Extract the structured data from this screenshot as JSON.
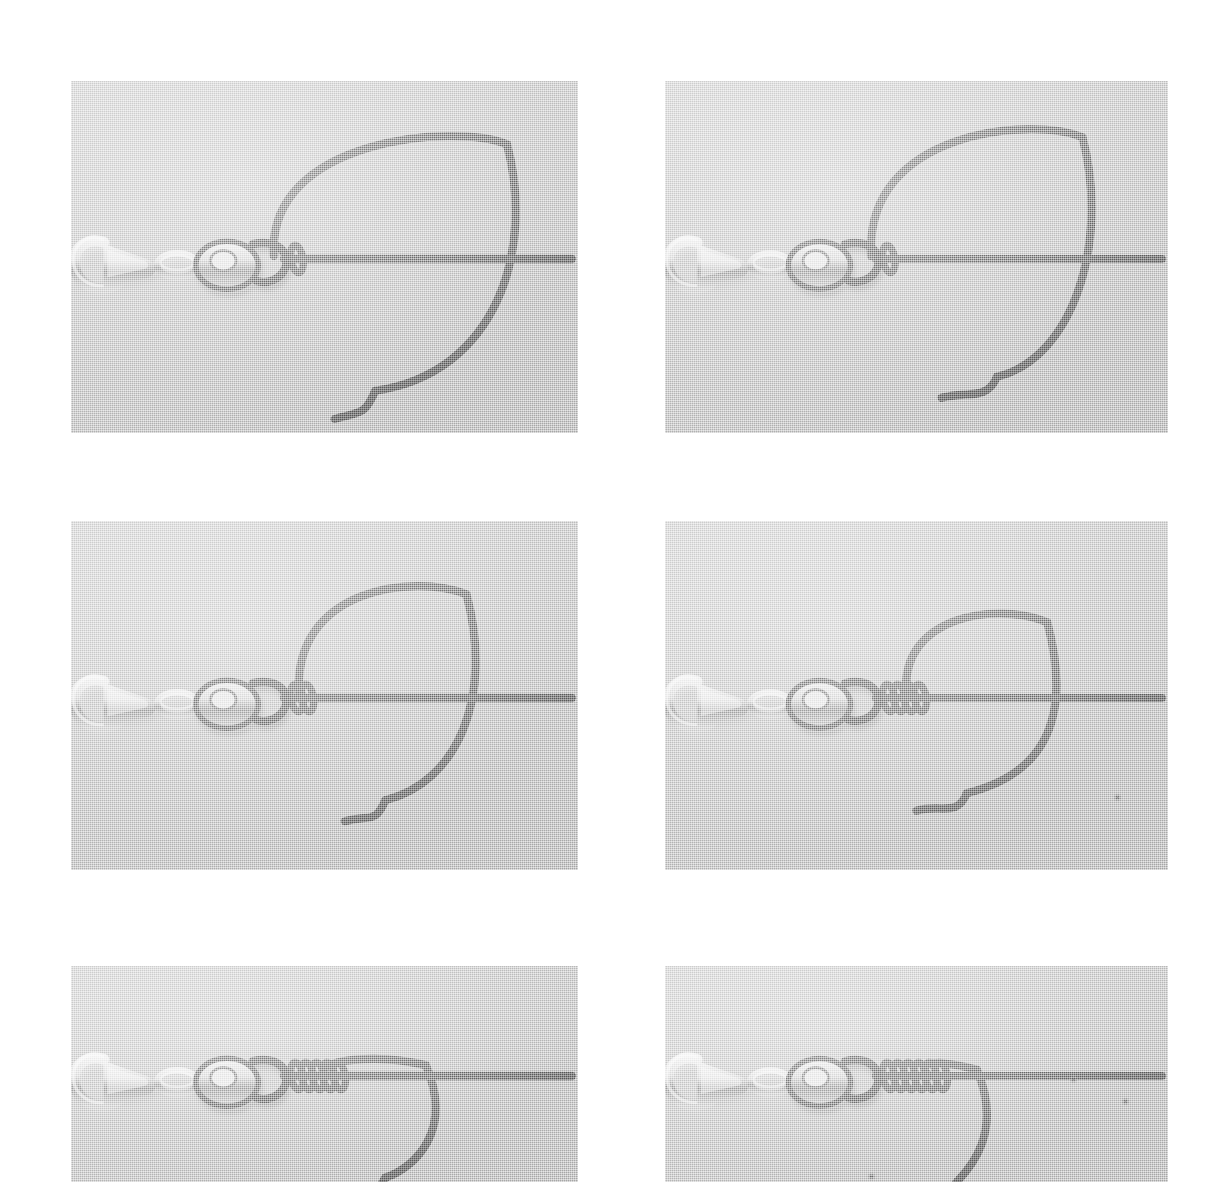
{
  "sheet": {
    "title": "Fishing knot tying photo sequence",
    "layout": "2 columns x 3 rows of photographs",
    "page_background": "#ffffff",
    "photo_background": "#c9c9c9",
    "line_color": "#6e6e6e",
    "hardware_color": "#d8d8d8"
  },
  "panels": [
    {
      "id": "panel-1",
      "step_number": "1",
      "caption": "Loose overhand loop formed: tag end passed through swivel eye and crossed over the standing line, large open loop hanging below",
      "x": 71,
      "y": 81,
      "width": 507,
      "height": 352,
      "wrap_count": 1,
      "loop_size": "large",
      "tag_end_position": "below-left, pointing left",
      "subject": "snap swivel with monofilament loop"
    },
    {
      "id": "panel-2",
      "step_number": "2",
      "caption": "Loop drawn slightly smaller, tag end brought around to the right side of the standing line",
      "x": 665,
      "y": 81,
      "width": 503,
      "height": 352,
      "wrap_count": 1,
      "loop_size": "large",
      "tag_end_position": "below-centre, curling left",
      "subject": "snap swivel with monofilament loop"
    },
    {
      "id": "panel-3",
      "step_number": "3",
      "caption": "First wraps taken around the standing line, loop reduced in size",
      "x": 71,
      "y": 521,
      "width": 507,
      "height": 349,
      "wrap_count": 2,
      "loop_size": "medium-large",
      "tag_end_position": "below-centre, short curl",
      "subject": "snap swivel with monofilament loop"
    },
    {
      "id": "panel-4",
      "step_number": "4",
      "caption": "Several coils wrapped tight against the swivel eye, loop pulled down further",
      "x": 665,
      "y": 521,
      "width": 503,
      "height": 349,
      "wrap_count": 4,
      "loop_size": "medium",
      "tag_end_position": "below-left of loop, short curl",
      "subject": "snap swivel with monofilament loop"
    },
    {
      "id": "panel-5",
      "step_number": "5",
      "caption": "Knot drawn down, coils seated against the swivel and only a small loop remains",
      "x": 71,
      "y": 966,
      "width": 507,
      "height": 216,
      "wrap_count": 5,
      "loop_size": "small",
      "tag_end_position": "hanging below, cropped by frame edge",
      "subject": "snap swivel with monofilament loop"
    },
    {
      "id": "panel-6",
      "step_number": "6",
      "caption": "Finished knot: coils snugged tight, loop almost closed and tag end trimmed short",
      "x": 665,
      "y": 966,
      "width": 503,
      "height": 216,
      "wrap_count": 6,
      "loop_size": "very-small",
      "tag_end_position": "hanging below, cropped by frame edge",
      "subject": "snap swivel with monofilament loop"
    }
  ],
  "hardware": {
    "snap_hook_label": "snap hook",
    "swivel_barrel_label": "barrel swivel",
    "swivel_eye_label": "swivel eye"
  },
  "artifacts": [
    {
      "panel": "panel-4",
      "kind": "dust-speck",
      "x": 1113,
      "y": 793
    },
    {
      "panel": "panel-6",
      "kind": "dust-speck",
      "x": 1069,
      "y": 1075
    },
    {
      "panel": "panel-6",
      "kind": "dust-speck",
      "x": 1121,
      "y": 1097
    },
    {
      "panel": "panel-6",
      "kind": "dust-speck",
      "x": 867,
      "y": 1172
    }
  ]
}
